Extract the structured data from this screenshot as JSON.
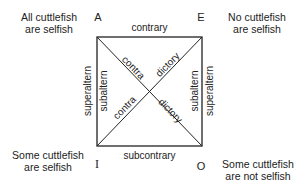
{
  "corners": {
    "A": {
      "letter": "A",
      "statement_line1": "All cuttlefish",
      "statement_line2": "are selfish"
    },
    "E": {
      "letter": "E",
      "statement_line1": "No cuttlefish",
      "statement_line2": "are selfish"
    },
    "I": {
      "letter": "I",
      "statement_line1": "Some cuttlefish",
      "statement_line2": "are selfish"
    },
    "O": {
      "letter": "O",
      "statement_line1": "Some cuttlefish",
      "statement_line2": "are not selfish"
    }
  },
  "relations": {
    "top": "contrary",
    "bottom": "subcontrary",
    "left_outer": "superaltern",
    "left_inner": "subaltern",
    "right_inner": "subaltern",
    "right_outer": "superaltern",
    "diag_ao_upper": "contra",
    "diag_ao_lower": "dictory",
    "diag_ie_lower": "contra",
    "diag_ie_upper": "dictory"
  },
  "colors": {
    "line": "#222222",
    "text": "#222222",
    "background": "#ffffff"
  }
}
